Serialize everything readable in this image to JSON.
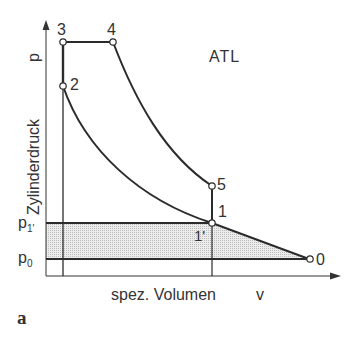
{
  "diagram": {
    "title": "ATL",
    "panel_label": "a",
    "axes": {
      "y_label": "Zylinderdruck",
      "y_symbol": "p",
      "x_label": "spez. Volumen",
      "x_symbol": "v",
      "y_ticks": [
        {
          "label_main": "p",
          "label_sub": "1'",
          "level": "p1'"
        },
        {
          "label_main": "p",
          "label_sub": "0",
          "level": "p0"
        }
      ]
    },
    "points": [
      {
        "id": "0",
        "label": "0"
      },
      {
        "id": "1",
        "label": "1"
      },
      {
        "id": "1'",
        "label": "1'"
      },
      {
        "id": "2",
        "label": "2"
      },
      {
        "id": "3",
        "label": "3"
      },
      {
        "id": "4",
        "label": "4"
      },
      {
        "id": "5",
        "label": "5"
      }
    ],
    "processes": [
      {
        "from": "0",
        "to": "1",
        "type": "compression (turbocharger)"
      },
      {
        "from": "1",
        "to": "2",
        "type": "polytropic compression"
      },
      {
        "from": "2",
        "to": "3",
        "type": "isochoric heat addition"
      },
      {
        "from": "3",
        "to": "4",
        "type": "isobaric heat addition"
      },
      {
        "from": "4",
        "to": "5",
        "type": "polytropic expansion"
      },
      {
        "from": "5",
        "to": "1",
        "type": "isochoric heat rejection"
      }
    ],
    "colors": {
      "line": "#2b2b2b",
      "shade": "#e2e2e2",
      "text": "#333333"
    }
  }
}
